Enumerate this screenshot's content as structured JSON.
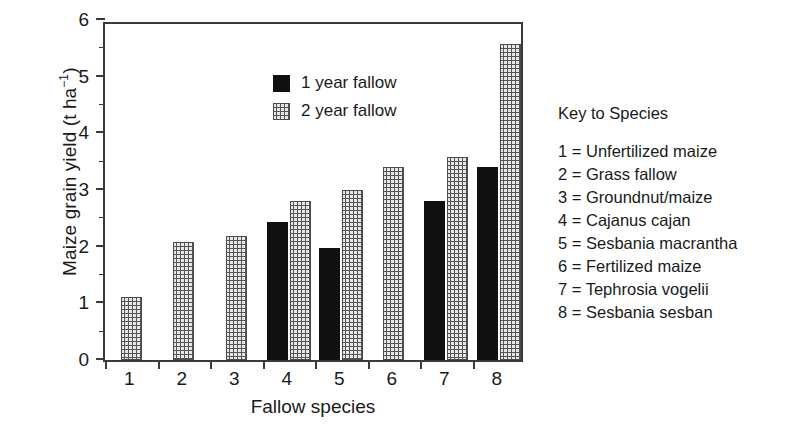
{
  "chart_data": {
    "type": "bar",
    "title": "",
    "xlabel": "Fallow species",
    "ylabel": "Maize grain yield (t ha−1)",
    "ylabel_base": "Maize grain yield (t ha",
    "ylabel_exponent": "−1",
    "ylabel_close": ")",
    "categories": [
      "1",
      "2",
      "3",
      "4",
      "5",
      "6",
      "7",
      "8"
    ],
    "ylim": [
      0,
      6
    ],
    "ytick_labels": [
      "0",
      "1",
      "2",
      "3",
      "4",
      "5",
      "6"
    ],
    "ytick_values": [
      0,
      1,
      2,
      3,
      4,
      5,
      6
    ],
    "yminor_values": [
      0.5,
      1.5,
      2.5,
      3.5,
      4.5,
      5.5
    ],
    "grid": false,
    "legend_position": "inside-upper-left",
    "series": [
      {
        "name": "1 year fallow",
        "style": "solid-black",
        "color": "#101010",
        "values": [
          null,
          null,
          null,
          2.43,
          1.98,
          null,
          2.8,
          3.4
        ]
      },
      {
        "name": "2 year fallow",
        "style": "dotted-fill",
        "color": "#e8e8e8",
        "values": [
          1.12,
          2.08,
          2.18,
          2.8,
          3.0,
          3.4,
          3.58,
          5.57
        ]
      }
    ]
  },
  "legend": {
    "items": [
      {
        "label": "1 year fallow",
        "swatch": "solid"
      },
      {
        "label": "2 year fallow",
        "swatch": "dotted"
      }
    ]
  },
  "species_key": {
    "title": "Key to Species",
    "entries": [
      "1 = Unfertilized maize",
      "2 = Grass fallow",
      "3 = Groundnut/maize",
      "4 = Cajanus cajan",
      "5 = Sesbania macrantha",
      "6 = Fertilized maize",
      "7 = Tephrosia vogelii",
      "8 = Sesbania sesban"
    ]
  }
}
